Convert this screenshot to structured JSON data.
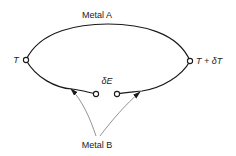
{
  "diagram": {
    "type": "thermocouple-circuit",
    "labels": {
      "metal_a": "Metal A",
      "metal_b": "Metal B",
      "left_junction": "T",
      "right_junction": "T + δT",
      "emf": "δE"
    },
    "colors": {
      "wire": "#1a1a1a",
      "arrow": "#555555",
      "text": "#222222",
      "background": "#ffffff"
    }
  }
}
